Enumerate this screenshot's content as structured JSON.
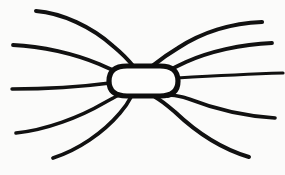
{
  "figure": {
    "style": "hand-drawn ink line drawing",
    "background_color": "#fbfbfa",
    "ink_color": "#111111",
    "width": 285,
    "height": 175
  },
  "core": {
    "name": "central oval body",
    "shape": "stadium / rounded oval",
    "fill_color": "#fdfdfc",
    "stroke_color": "#0d0d0d",
    "stroke_width": 5.2,
    "bounds": {
      "x": 109,
      "y": 66,
      "width": 69,
      "height": 30
    },
    "center": {
      "x": 143.5,
      "y": 81
    },
    "path": "M 127 66 L 160 66 C 172 66 178 71 178 81 C 178 91 172 96 160 96 L 127 96 C 115 96 109 91 109 81 C 109 71 115 66 127 66 Z"
  },
  "field_lines": {
    "count": 10,
    "left_count": 5,
    "right_count": 5,
    "stroke_width_range": [
      3.0,
      4.4
    ],
    "items": [
      {
        "id": "left-upper-outer",
        "side": "left",
        "tier": "upper-outer",
        "stroke_width": 4.0,
        "start": {
          "x": 36,
          "y": 11
        },
        "end": {
          "x": 134,
          "y": 67
        },
        "path": "M 36 11 C 62 13 92 27 113 46 C 124 55 130 62 134 67"
      },
      {
        "id": "left-upper-inner",
        "side": "left",
        "tier": "upper-inner",
        "stroke_width": 3.8,
        "start": {
          "x": 13,
          "y": 45
        },
        "end": {
          "x": 121,
          "y": 73
        },
        "path": "M 13 45 C 42 46 75 54 99 64 C 110 69 117 72 121 73"
      },
      {
        "id": "left-middle",
        "side": "left",
        "tier": "middle",
        "stroke_width": 3.4,
        "start": {
          "x": 12,
          "y": 89
        },
        "end": {
          "x": 110,
          "y": 83
        },
        "path": "M 12 89 C 44 89 80 87 110 83"
      },
      {
        "id": "left-lower-inner",
        "side": "left",
        "tier": "lower-inner",
        "stroke_width": 3.6,
        "start": {
          "x": 16,
          "y": 133
        },
        "end": {
          "x": 119,
          "y": 95
        },
        "path": "M 16 133 C 46 130 80 117 104 103 C 113 98 117 96 119 95"
      },
      {
        "id": "left-lower-outer",
        "side": "left",
        "tier": "lower-outer",
        "stroke_width": 3.8,
        "start": {
          "x": 53,
          "y": 158
        },
        "end": {
          "x": 131,
          "y": 97
        },
        "path": "M 53 158 C 78 150 103 133 120 113 C 127 105 130 99 131 97"
      },
      {
        "id": "right-upper-outer",
        "side": "right",
        "tier": "upper-outer",
        "stroke_width": 4.2,
        "start": {
          "x": 262,
          "y": 22
        },
        "end": {
          "x": 151,
          "y": 67
        },
        "path": "M 262 22 C 231 23 201 33 178 48 C 163 57 155 64 151 67"
      },
      {
        "id": "right-upper-inner",
        "side": "right",
        "tier": "upper-inner",
        "stroke_width": 3.8,
        "start": {
          "x": 272,
          "y": 43
        },
        "end": {
          "x": 166,
          "y": 72
        },
        "path": "M 272 43 C 241 44 208 52 186 62 C 173 68 168 71 166 72"
      },
      {
        "id": "right-middle",
        "side": "right",
        "tier": "middle",
        "stroke_width": 3.2,
        "start": {
          "x": 283,
          "y": 73
        },
        "end": {
          "x": 177,
          "y": 78
        },
        "path": "M 283 73 C 250 74 211 76 177 78"
      },
      {
        "id": "right-lower-inner",
        "side": "right",
        "tier": "lower-inner",
        "stroke_width": 3.6,
        "start": {
          "x": 275,
          "y": 118
        },
        "end": {
          "x": 168,
          "y": 96
        },
        "path": "M 275 118 C 244 116 212 108 189 99 C 176 95 170 95 168 96"
      },
      {
        "id": "right-lower-outer",
        "side": "right",
        "tier": "lower-outer",
        "stroke_width": 4.0,
        "start": {
          "x": 249,
          "y": 157
        },
        "end": {
          "x": 155,
          "y": 97
        },
        "path": "M 249 157 C 222 149 196 132 175 112 C 162 101 157 98 155 97"
      }
    ]
  }
}
